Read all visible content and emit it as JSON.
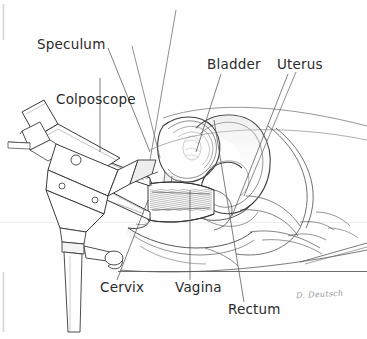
{
  "figure": {
    "background_color": "#fefefe",
    "ink_color": "#3a3a3a",
    "label_color": "#2b2b2b",
    "signature": "D. Deutsch",
    "signature_color": "#9a9a9a"
  },
  "labels": {
    "speculum": "Speculum",
    "colposcope": "Colposcope",
    "bladder": "Bladder",
    "uterus": "Uterus",
    "cervix": "Cervix",
    "vagina": "Vagina",
    "rectum": "Rectum"
  }
}
